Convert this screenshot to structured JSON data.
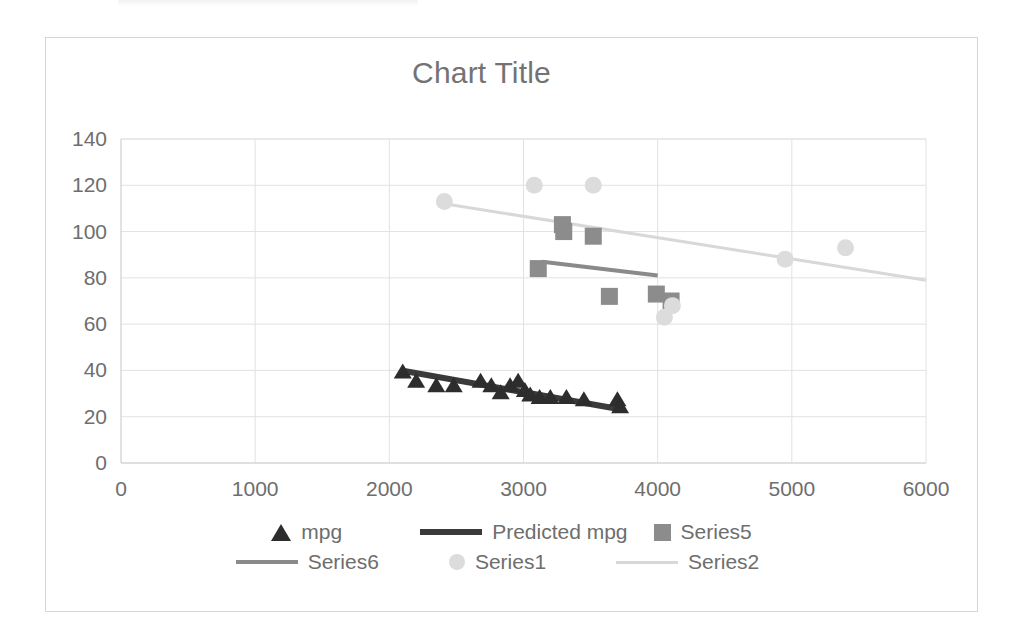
{
  "chart": {
    "title": "Chart Title",
    "frame": {
      "border_color": "#d6d6d6",
      "background": "#ffffff"
    }
  },
  "legend": {
    "rows": [
      [
        {
          "label": "mpg",
          "key": "triangle-marker",
          "color": "#2d2d2d"
        },
        {
          "label": "Predicted mpg",
          "key": "thick-dark-line",
          "color": "#3a3a3a"
        },
        {
          "label": "Series5",
          "key": "square-marker",
          "color": "#8c8c8c"
        }
      ],
      [
        {
          "label": "Series6",
          "key": "medium-gray-line",
          "color": "#8a8a8a"
        },
        {
          "label": "Series1",
          "key": "circle-marker",
          "color": "#dcdcdc"
        },
        {
          "label": "Series2",
          "key": "light-gray-line",
          "color": "#d8d8d8"
        }
      ]
    ]
  },
  "chart_data": {
    "type": "scatter",
    "title": "Chart Title",
    "xlabel": "",
    "ylabel": "",
    "xlim": [
      0,
      6000
    ],
    "ylim": [
      0,
      140
    ],
    "xticks": [
      0,
      1000,
      2000,
      3000,
      4000,
      5000,
      6000
    ],
    "yticks": [
      0,
      20,
      40,
      60,
      80,
      100,
      120,
      140
    ],
    "grid": true,
    "legend_position": "bottom",
    "series": [
      {
        "name": "mpg",
        "marker": "triangle",
        "color": "#2d2d2d",
        "points": [
          [
            2100,
            39
          ],
          [
            2200,
            35
          ],
          [
            2350,
            33
          ],
          [
            2480,
            33
          ],
          [
            2680,
            35
          ],
          [
            2760,
            33
          ],
          [
            2830,
            30
          ],
          [
            2900,
            33
          ],
          [
            2960,
            35
          ],
          [
            3010,
            31
          ],
          [
            3050,
            29
          ],
          [
            3120,
            28
          ],
          [
            3200,
            28
          ],
          [
            3320,
            28
          ],
          [
            3450,
            27
          ],
          [
            3700,
            27
          ],
          [
            3720,
            24
          ]
        ]
      },
      {
        "name": "Predicted mpg",
        "marker": "none",
        "type": "line",
        "color": "#3a3a3a",
        "line_width": 6,
        "points": [
          [
            2090,
            40
          ],
          [
            3740,
            23
          ]
        ]
      },
      {
        "name": "Series5",
        "marker": "square",
        "color": "#8c8c8c",
        "points": [
          [
            3110,
            84
          ],
          [
            3290,
            103
          ],
          [
            3300,
            100
          ],
          [
            3520,
            98
          ],
          [
            3640,
            72
          ],
          [
            3990,
            73
          ],
          [
            4100,
            70
          ]
        ]
      },
      {
        "name": "Series6",
        "marker": "none",
        "type": "line",
        "color": "#8a8a8a",
        "line_width": 4,
        "points": [
          [
            3140,
            87
          ],
          [
            4000,
            81
          ]
        ]
      },
      {
        "name": "Series1",
        "marker": "circle",
        "color": "#dcdcdc",
        "points": [
          [
            2410,
            113
          ],
          [
            3080,
            120
          ],
          [
            3520,
            120
          ],
          [
            4050,
            63
          ],
          [
            4110,
            68
          ],
          [
            4950,
            88
          ],
          [
            5400,
            93
          ]
        ]
      },
      {
        "name": "Series2",
        "marker": "none",
        "type": "line",
        "color": "#d8d8d8",
        "line_width": 3,
        "points": [
          [
            2410,
            112
          ],
          [
            6000,
            79
          ]
        ]
      }
    ]
  }
}
